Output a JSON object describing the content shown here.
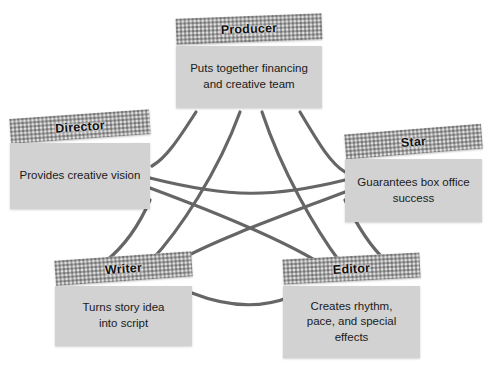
{
  "diagram": {
    "background_color": "#ffffff",
    "connector_color": "#666666",
    "header_texture_color": "#aaaaaa",
    "body_color": "#d2d2d2",
    "nodes": [
      {
        "id": "producer",
        "header": "Producer",
        "body": "Puts together financing\nand creative team"
      },
      {
        "id": "director",
        "header": "Director",
        "body": "Provides creative vision"
      },
      {
        "id": "star",
        "header": "Star",
        "body": "Guarantees box office\nsuccess"
      },
      {
        "id": "writer",
        "header": "Writer",
        "body": "Turns story idea\ninto script"
      },
      {
        "id": "editor",
        "header": "Editor",
        "body": "Creates rhythm,\npace, and special\neffects"
      }
    ],
    "connections": [
      {
        "from": "producer",
        "to": "director"
      },
      {
        "from": "producer",
        "to": "star"
      },
      {
        "from": "producer",
        "to": "writer"
      },
      {
        "from": "producer",
        "to": "editor"
      },
      {
        "from": "director",
        "to": "star"
      },
      {
        "from": "director",
        "to": "writer"
      },
      {
        "from": "director",
        "to": "editor"
      },
      {
        "from": "star",
        "to": "writer"
      },
      {
        "from": "star",
        "to": "editor"
      },
      {
        "from": "writer",
        "to": "editor"
      }
    ]
  }
}
